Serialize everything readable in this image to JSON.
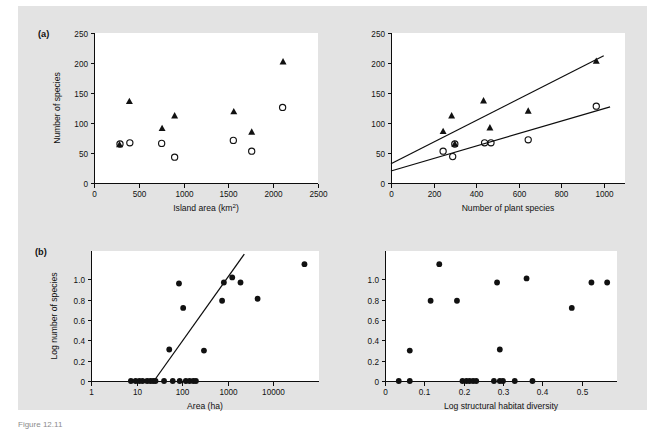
{
  "figure": {
    "background_color": "#e3e3e3",
    "page_color": "#ffffff",
    "marker_color": "#111111",
    "line_color": "#0d0d0d",
    "caption": "Figure 12.11"
  },
  "panels": {
    "a_tag": "(a)",
    "b_tag": "(b)"
  },
  "chart_data": [
    {
      "id": "panel-a-left",
      "type": "scatter",
      "title": "",
      "panel_label": "(a)",
      "xlabel": "Island area (km2)",
      "xlabel_main": "Island area (km",
      "xlabel_sup": "2",
      "xlabel_tail": ")",
      "ylabel": "Number of species",
      "xlim": [
        0,
        2500
      ],
      "ylim": [
        0,
        250
      ],
      "xticks": [
        0,
        500,
        1000,
        1500,
        2000,
        2500
      ],
      "xticklabels": [
        "0",
        "500",
        "1000",
        "1500",
        "2000",
        "2500"
      ],
      "yticks": [
        0,
        50,
        100,
        150,
        200,
        250
      ],
      "yticklabels": [
        "0",
        "50",
        "100",
        "150",
        "200",
        "250"
      ],
      "grid": false,
      "legend": "none",
      "series": [
        {
          "name": "triangles",
          "marker": "filled-triangle",
          "points": [
            [
              285,
              64
            ],
            [
              395,
              136
            ],
            [
              760,
              91
            ],
            [
              900,
              112
            ],
            [
              1560,
              119
            ],
            [
              1760,
              85
            ],
            [
              2110,
              202
            ]
          ]
        },
        {
          "name": "circles",
          "marker": "open-circle",
          "points": [
            [
              290,
              65
            ],
            [
              400,
              67
            ],
            [
              755,
              66
            ],
            [
              900,
              43
            ],
            [
              1555,
              71
            ],
            [
              1760,
              53
            ],
            [
              2105,
              126
            ]
          ]
        }
      ]
    },
    {
      "id": "panel-a-right",
      "type": "scatter",
      "title": "",
      "panel_label": "",
      "xlabel": "Number of plant species",
      "ylabel": "",
      "xlim": [
        0,
        1100
      ],
      "ylim": [
        0,
        250
      ],
      "xticks": [
        0,
        200,
        400,
        600,
        800,
        1000
      ],
      "xticklabels": [
        "0",
        "200",
        "400",
        "600",
        "800",
        "1000"
      ],
      "yticks": [
        0,
        50,
        100,
        150,
        200,
        250
      ],
      "yticklabels": [
        "0",
        "50",
        "100",
        "150",
        "200",
        "250"
      ],
      "grid": false,
      "legend": "none",
      "series": [
        {
          "name": "triangles",
          "marker": "filled-triangle",
          "points": [
            [
              245,
              86
            ],
            [
              285,
              112
            ],
            [
              300,
              65
            ],
            [
              435,
              137
            ],
            [
              465,
              92
            ],
            [
              645,
              120
            ],
            [
              965,
              203
            ]
          ]
        },
        {
          "name": "circles",
          "marker": "open-circle",
          "points": [
            [
              245,
              53
            ],
            [
              290,
              44
            ],
            [
              300,
              65
            ],
            [
              440,
              67
            ],
            [
              470,
              67
            ],
            [
              645,
              72
            ],
            [
              965,
              128
            ]
          ]
        }
      ],
      "fits": [
        {
          "name": "triangle-fit",
          "x0": 0,
          "y0": 32,
          "x1": 1000,
          "y1": 212
        },
        {
          "name": "circle-fit",
          "x0": 0,
          "y0": 20,
          "x1": 1030,
          "y1": 127
        }
      ]
    },
    {
      "id": "panel-b-left",
      "type": "scatter",
      "title": "",
      "panel_label": "(b)",
      "xlabel": "Area (ha)",
      "ylabel": "Log number of species",
      "xscale": "log",
      "xlim": [
        1,
        100000
      ],
      "ylim": [
        0,
        1.28
      ],
      "xticks": [
        1,
        10,
        100,
        1000,
        10000
      ],
      "xticklabels": [
        "1",
        "10",
        "100",
        "1000",
        "10000"
      ],
      "yticks": [
        0,
        0.2,
        0.4,
        0.6,
        0.8,
        1.0
      ],
      "yticklabels": [
        "0",
        "0.2",
        "0.4",
        "0.6",
        "0.8",
        "1.0"
      ],
      "grid": false,
      "legend": "none",
      "series": [
        {
          "name": "sites",
          "marker": "filled-circle",
          "points": [
            [
              7.5,
              0.0
            ],
            [
              9.5,
              0.0
            ],
            [
              11.5,
              0.0
            ],
            [
              13.5,
              0.0
            ],
            [
              17,
              0.0
            ],
            [
              20,
              0.0
            ],
            [
              23,
              0.0
            ],
            [
              26,
              0.0
            ],
            [
              40,
              0.0
            ],
            [
              62,
              0.0
            ],
            [
              88,
              0.0
            ],
            [
              120,
              0.0
            ],
            [
              145,
              0.0
            ],
            [
              175,
              0.0
            ],
            [
              200,
              0.0
            ],
            [
              52,
              0.31
            ],
            [
              85,
              0.96
            ],
            [
              105,
              0.72
            ],
            [
              300,
              0.3
            ],
            [
              750,
              0.79
            ],
            [
              820,
              0.97
            ],
            [
              1250,
              1.02
            ],
            [
              1900,
              0.97
            ],
            [
              4500,
              0.81
            ],
            [
              48000,
              1.15
            ]
          ]
        }
      ],
      "fits": [
        {
          "name": "area-fit",
          "x0": 24,
          "y0": 0.0,
          "x1": 2300,
          "y1": 1.25
        }
      ]
    },
    {
      "id": "panel-b-right",
      "type": "scatter",
      "title": "",
      "panel_label": "",
      "xlabel": "Log structural habitat diversity",
      "ylabel": "",
      "xlim": [
        0,
        0.59
      ],
      "ylim": [
        0,
        1.28
      ],
      "xticks": [
        0,
        0.1,
        0.2,
        0.3,
        0.4,
        0.5
      ],
      "xticklabels": [
        "0",
        "0.1",
        "0.2",
        "0.3",
        "0.4",
        "0.5"
      ],
      "yticks": [
        0,
        0.2,
        0.4,
        0.6,
        0.8,
        1.0
      ],
      "yticklabels": [
        "0",
        "0.2",
        "0.4",
        "0.6",
        "0.8",
        "1.0"
      ],
      "grid": false,
      "legend": "none",
      "series": [
        {
          "name": "sites",
          "marker": "filled-circle",
          "points": [
            [
              0.035,
              0.0
            ],
            [
              0.063,
              0.0
            ],
            [
              0.197,
              0.0
            ],
            [
              0.207,
              0.0
            ],
            [
              0.215,
              0.0
            ],
            [
              0.224,
              0.0
            ],
            [
              0.232,
              0.0
            ],
            [
              0.277,
              0.0
            ],
            [
              0.292,
              0.0
            ],
            [
              0.3,
              0.0
            ],
            [
              0.33,
              0.0
            ],
            [
              0.375,
              0.0
            ],
            [
              0.063,
              0.3
            ],
            [
              0.292,
              0.31
            ],
            [
              0.116,
              0.79
            ],
            [
              0.183,
              0.79
            ],
            [
              0.475,
              0.72
            ],
            [
              0.285,
              0.97
            ],
            [
              0.36,
              1.01
            ],
            [
              0.525,
              0.97
            ],
            [
              0.565,
              0.97
            ],
            [
              0.138,
              1.15
            ]
          ]
        }
      ]
    }
  ]
}
